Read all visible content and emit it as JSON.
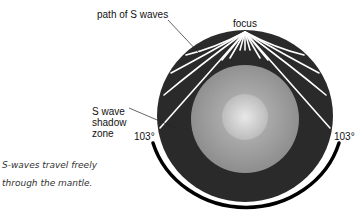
{
  "diagram": {
    "labels": {
      "path": "path of S waves",
      "focus": "focus",
      "shadow_line1": "S wave",
      "shadow_line2": "shadow",
      "shadow_line3": "zone",
      "angle_left": "103°",
      "angle_right": "103°"
    },
    "caption_line1": "S-waves travel freely",
    "caption_line2": "through the mantle.",
    "colors": {
      "mantle": "#2b2b2b",
      "outer_core": "#9a9a9a",
      "inner_core": "#d0d0d0",
      "wave": "#ffffff",
      "arc": "#000000"
    }
  }
}
